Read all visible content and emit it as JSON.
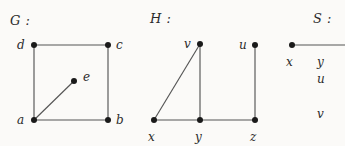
{
  "figure": {
    "background_color": "#fbfaf8",
    "node_color": "#1a1a1a",
    "edge_color": "#555555",
    "text_color": "#2b2b2b"
  },
  "graphs": [
    {
      "id": "G",
      "title": "G :",
      "title_pos": {
        "x": 10,
        "y": 13
      },
      "vertices": [
        {
          "name": "d",
          "x": 34,
          "y": 45,
          "label_x": 17,
          "label_y": 38
        },
        {
          "name": "c",
          "x": 108,
          "y": 45,
          "label_x": 116,
          "label_y": 38
        },
        {
          "name": "e",
          "x": 74,
          "y": 81,
          "label_x": 83,
          "label_y": 70
        },
        {
          "name": "a",
          "x": 34,
          "y": 120,
          "label_x": 17,
          "label_y": 113
        },
        {
          "name": "b",
          "x": 108,
          "y": 120,
          "label_x": 116,
          "label_y": 113
        }
      ],
      "edges": [
        {
          "from": "d",
          "to": "c"
        },
        {
          "from": "d",
          "to": "a"
        },
        {
          "from": "c",
          "to": "b"
        },
        {
          "from": "a",
          "to": "b"
        },
        {
          "from": "a",
          "to": "e"
        }
      ]
    },
    {
      "id": "H",
      "title": "H :",
      "title_pos": {
        "x": 150,
        "y": 11
      },
      "vertices": [
        {
          "name": "v",
          "x": 200,
          "y": 44,
          "label_x": 184,
          "label_y": 37
        },
        {
          "name": "u",
          "x": 255,
          "y": 45,
          "label_x": 239,
          "label_y": 38
        },
        {
          "name": "x",
          "x": 154,
          "y": 120,
          "label_x": 148,
          "label_y": 130
        },
        {
          "name": "y",
          "x": 200,
          "y": 120,
          "label_x": 195,
          "label_y": 130
        },
        {
          "name": "z",
          "x": 255,
          "y": 120,
          "label_x": 250,
          "label_y": 130
        }
      ],
      "edges": [
        {
          "from": "v",
          "to": "x"
        },
        {
          "from": "v",
          "to": "y"
        },
        {
          "from": "u",
          "to": "z"
        },
        {
          "from": "x",
          "to": "y"
        },
        {
          "from": "y",
          "to": "z"
        }
      ]
    },
    {
      "id": "S",
      "title": "S :",
      "title_pos": {
        "x": 313,
        "y": 11
      },
      "clipped": true,
      "vertices": [
        {
          "name": "x",
          "x": 292,
          "y": 45,
          "label_x": 286,
          "label_y": 55
        },
        {
          "name": "y",
          "label_x": 317,
          "label_y": 55
        },
        {
          "name": "u",
          "label_x": 317,
          "label_y": 72
        },
        {
          "name": "v",
          "label_x": 317,
          "label_y": 107
        }
      ],
      "edges": [
        {
          "from": "x",
          "to_edge_x": 345,
          "y": 45
        }
      ]
    }
  ]
}
